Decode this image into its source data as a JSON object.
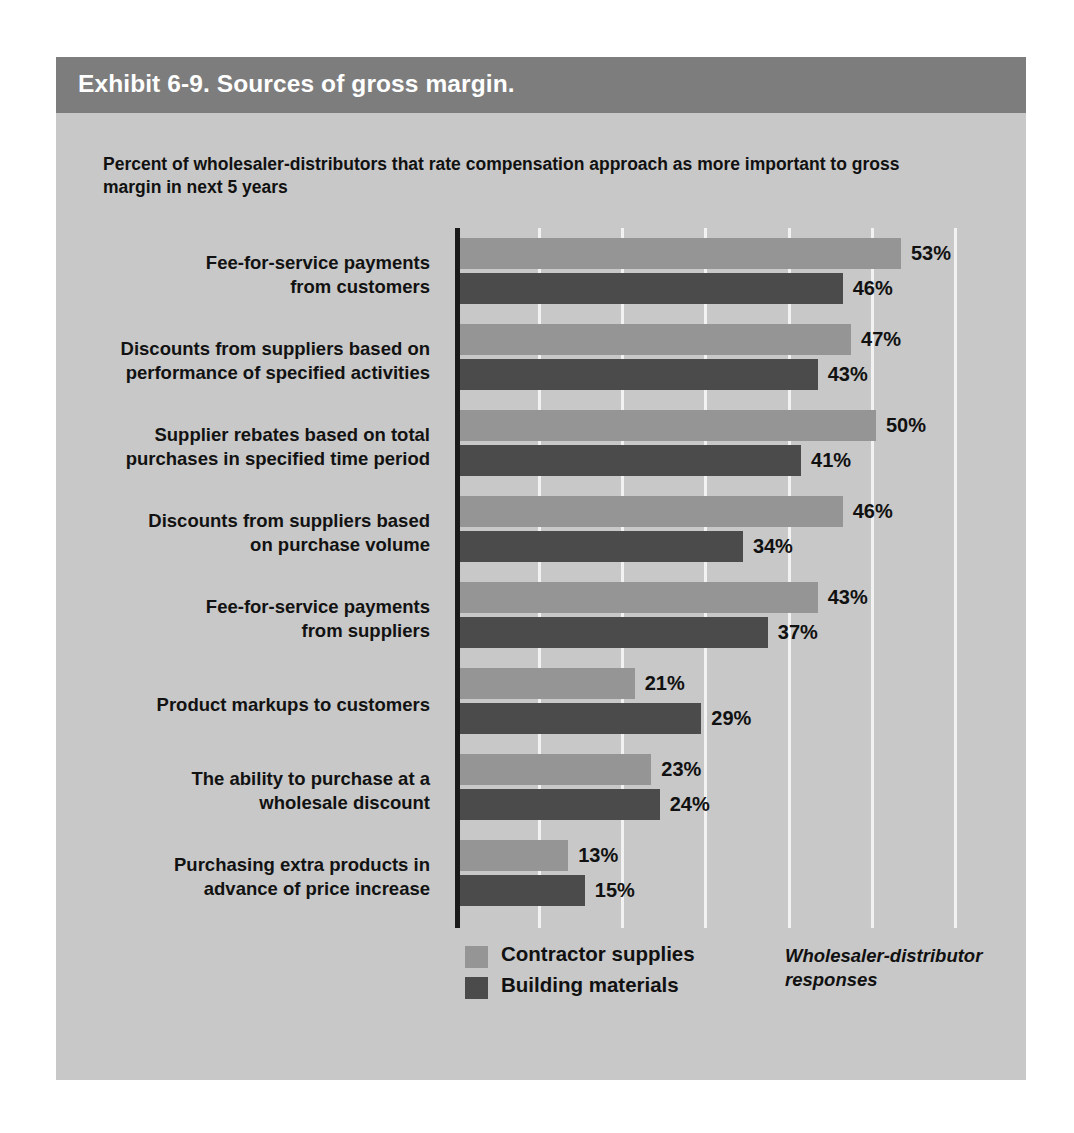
{
  "exhibit": {
    "title": "Exhibit 6-9. Sources of gross margin.",
    "subtitle": "Percent of wholesaler-distributors that rate compensation approach as more important to gross margin in next 5 years",
    "source_note": "Wholesaler-distributor responses",
    "colors": {
      "card_background": "#c8c8c8",
      "title_band": "#7d7d7d",
      "title_text": "#ffffff",
      "series_light": "#959595",
      "series_dark": "#4b4b4b",
      "gridline": "#f2f2f2",
      "axis": "#1a1a1a",
      "text": "#111111"
    }
  },
  "chart_data": {
    "type": "bar",
    "orientation": "horizontal",
    "title": "Exhibit 6-9. Sources of gross margin.",
    "subtitle": "Percent of wholesaler-distributors that rate compensation approach as more important to gross margin in next 5 years",
    "xlabel": "",
    "ylabel": "",
    "xlim": [
      0,
      60
    ],
    "grid": true,
    "gridline_values": [
      10,
      20,
      30,
      40,
      50,
      60
    ],
    "legend_position": "bottom",
    "value_suffix": "%",
    "categories": [
      "Fee-for-service payments from customers",
      "Discounts from suppliers based on performance of specified activities",
      "Supplier rebates based on total purchases in specified time period",
      "Discounts from suppliers based on purchase volume",
      "Fee-for-service payments from suppliers",
      "Product markups to customers",
      "The ability to purchase at a wholesale discount",
      "Purchasing extra products in advance of price increase"
    ],
    "category_lines": [
      [
        "Fee-for-service payments",
        "from customers"
      ],
      [
        "Discounts from suppliers based on",
        "performance of specified activities"
      ],
      [
        "Supplier rebates based on total",
        "purchases in specified time period"
      ],
      [
        "Discounts from suppliers based",
        "on purchase volume"
      ],
      [
        "Fee-for-service payments",
        "from suppliers"
      ],
      [
        "Product markups to customers"
      ],
      [
        "The ability to purchase at a",
        "wholesale discount"
      ],
      [
        "Purchasing extra products in",
        "advance of price increase"
      ]
    ],
    "series": [
      {
        "name": "Contractor supplies",
        "color": "#959595",
        "values": [
          53,
          47,
          50,
          46,
          43,
          21,
          23,
          13
        ],
        "labels": [
          "53%",
          "47%",
          "50%",
          "46%",
          "43%",
          "21%",
          "23%",
          "13%"
        ]
      },
      {
        "name": "Building materials",
        "color": "#4b4b4b",
        "values": [
          46,
          43,
          41,
          34,
          37,
          29,
          24,
          15
        ],
        "labels": [
          "46%",
          "43%",
          "41%",
          "34%",
          "37%",
          "29%",
          "24%",
          "15%"
        ]
      }
    ]
  }
}
